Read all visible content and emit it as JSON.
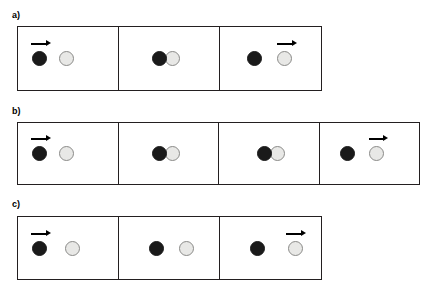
{
  "figure": {
    "colors": {
      "dark_ball": "#1a1a1a",
      "light_ball_fill": "#e8e8e6",
      "light_ball_stroke": "#8a8a88",
      "frame_border": "#231f20",
      "arrow": "#000000",
      "background": "#ffffff"
    }
  },
  "panels": [
    {
      "label": "a)",
      "label_x": 12,
      "label_y": 11,
      "strip_x": 17,
      "strip_y": 26,
      "strip_width": 305,
      "strip_height": 65,
      "cell_count": 3,
      "cells": [
        {
          "name": "frame-a1",
          "width": 101,
          "balls": [
            {
              "type": "dark",
              "x": 14,
              "d": 15
            },
            {
              "type": "light",
              "x": 41,
              "d": 15
            }
          ],
          "arrow": {
            "x": 13,
            "y": 12,
            "length": 20
          }
        },
        {
          "name": "frame-a2",
          "width": 101,
          "balls": [
            {
              "type": "dark",
              "x": 33,
              "d": 15
            },
            {
              "type": "light",
              "x": 46,
              "d": 15
            }
          ],
          "arrow": null
        },
        {
          "name": "frame-a3",
          "width": 101,
          "balls": [
            {
              "type": "dark",
              "x": 27,
              "d": 15
            },
            {
              "type": "light",
              "x": 57,
              "d": 15
            }
          ],
          "arrow": {
            "x": 57,
            "y": 12,
            "length": 20
          }
        }
      ]
    },
    {
      "label": "b)",
      "label_x": 12,
      "label_y": 107,
      "strip_x": 17,
      "strip_y": 122,
      "strip_width": 403,
      "strip_height": 63,
      "cell_count": 4,
      "cells": [
        {
          "name": "frame-b1",
          "width": 101,
          "balls": [
            {
              "type": "dark",
              "x": 14,
              "d": 15
            },
            {
              "type": "light",
              "x": 41,
              "d": 15
            }
          ],
          "arrow": {
            "x": 13,
            "y": 11,
            "length": 20
          }
        },
        {
          "name": "frame-b2",
          "width": 101,
          "balls": [
            {
              "type": "dark",
              "x": 33,
              "d": 15
            },
            {
              "type": "light",
              "x": 46,
              "d": 15
            }
          ],
          "arrow": null
        },
        {
          "name": "frame-b3",
          "width": 101,
          "balls": [
            {
              "type": "dark",
              "x": 38,
              "d": 15
            },
            {
              "type": "light",
              "x": 51,
              "d": 15
            }
          ],
          "arrow": null
        },
        {
          "name": "frame-b4",
          "width": 100,
          "balls": [
            {
              "type": "dark",
              "x": 20,
              "d": 15
            },
            {
              "type": "light",
              "x": 49,
              "d": 15
            }
          ],
          "arrow": {
            "x": 49,
            "y": 11,
            "length": 20
          }
        }
      ]
    },
    {
      "label": "c)",
      "label_x": 12,
      "label_y": 200,
      "strip_x": 17,
      "strip_y": 216,
      "strip_width": 305,
      "strip_height": 64,
      "cell_count": 3,
      "cells": [
        {
          "name": "frame-c1",
          "width": 101,
          "balls": [
            {
              "type": "dark",
              "x": 14,
              "d": 15
            },
            {
              "type": "light",
              "x": 47,
              "d": 15
            }
          ],
          "arrow": {
            "x": 13,
            "y": 12,
            "length": 20
          }
        },
        {
          "name": "frame-c2",
          "width": 101,
          "balls": [
            {
              "type": "dark",
              "x": 30,
              "d": 15
            },
            {
              "type": "light",
              "x": 60,
              "d": 15
            }
          ],
          "arrow": null
        },
        {
          "name": "frame-c3",
          "width": 101,
          "balls": [
            {
              "type": "dark",
              "x": 30,
              "d": 15
            },
            {
              "type": "light",
              "x": 68,
              "d": 15
            }
          ],
          "arrow": {
            "x": 66,
            "y": 12,
            "length": 20
          }
        }
      ]
    }
  ]
}
